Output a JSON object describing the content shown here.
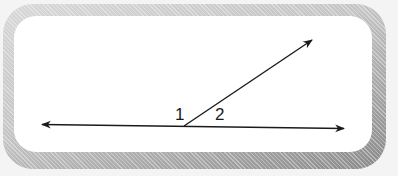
{
  "diagram": {
    "type": "adjacent-angles",
    "labels": {
      "angle_1": "1",
      "angle_2": "2"
    },
    "colors": {
      "line": "#1a1a1a",
      "panel": "#ffffff",
      "frame_light": "#d8d8d8",
      "frame_dark": "#8a8a8a"
    },
    "elements": {
      "line": {
        "from": [
          42,
          124
        ],
        "to": [
          344,
          129
        ],
        "arrows": "both"
      },
      "ray": {
        "from": [
          184,
          126
        ],
        "to": [
          312,
          40
        ],
        "arrows": "end"
      },
      "vertex": [
        184,
        126
      ]
    }
  }
}
